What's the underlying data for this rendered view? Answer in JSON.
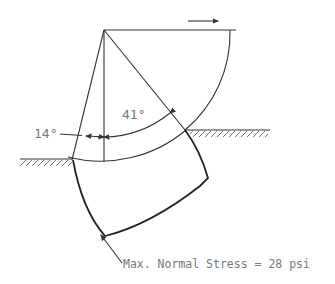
{
  "diagram": {
    "angle_left_label": "14°",
    "angle_right_label": "41°",
    "caption": "Max. Normal Stress = 28 psi",
    "line_color": "#333333",
    "text_color": "#777777"
  }
}
